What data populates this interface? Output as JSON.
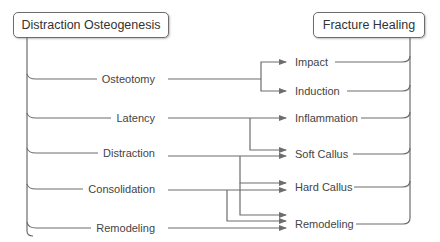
{
  "diagram": {
    "left_root": {
      "label": "Distraction Osteogenesis"
    },
    "right_root": {
      "label": "Fracture Healing"
    },
    "left_stages": [
      {
        "label": "Osteotomy",
        "y": 79
      },
      {
        "label": "Latency",
        "y": 118
      },
      {
        "label": "Distraction",
        "y": 153
      },
      {
        "label": "Consolidation",
        "y": 189
      },
      {
        "label": "Remodeling",
        "y": 228
      }
    ],
    "right_stages": [
      {
        "label": "Impact",
        "y": 62
      },
      {
        "label": "Induction",
        "y": 91
      },
      {
        "label": "Inflammation",
        "y": 118
      },
      {
        "label": "Soft Callus",
        "y": 154
      },
      {
        "label": "Hard Callus",
        "y": 187
      },
      {
        "label": "Remodeling",
        "y": 224
      }
    ],
    "mappings": [
      {
        "from": "Osteotomy",
        "to": [
          "Impact",
          "Induction"
        ]
      },
      {
        "from": "Latency",
        "to": [
          "Inflammation",
          "Soft Callus"
        ]
      },
      {
        "from": "Distraction",
        "to": [
          "Soft Callus",
          "Hard Callus",
          "Remodeling"
        ]
      },
      {
        "from": "Consolidation",
        "to": [
          "Hard Callus",
          "Remodeling"
        ]
      },
      {
        "from": "Remodeling",
        "to": [
          "Remodeling"
        ]
      }
    ],
    "colors": {
      "line": "#6d6d6d",
      "text": "#333333",
      "box_border": "#6d6d6d"
    }
  }
}
